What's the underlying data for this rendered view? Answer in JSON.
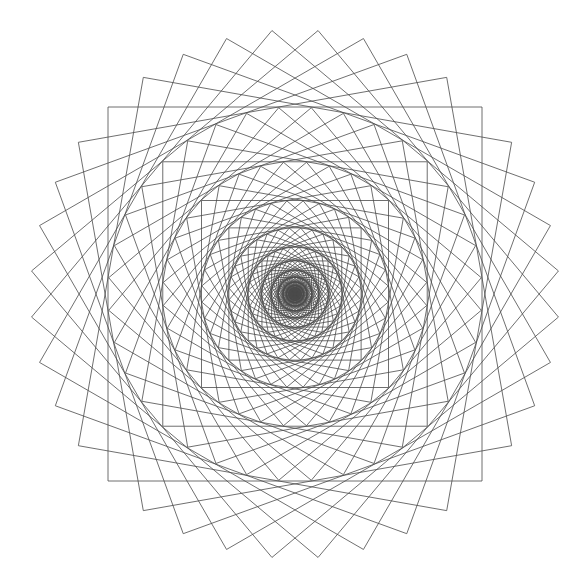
{
  "figure": {
    "title": "",
    "background": "#ffffff",
    "stroke_color": "#4a4a4a",
    "stroke_width": 0.8
  },
  "geometry": {
    "width": 585,
    "height": 587,
    "center": [
      295,
      294
    ],
    "outer_half_size": 187,
    "ring_scale": 0.7071,
    "squares_per_ring": 9,
    "rotation_step_deg": 10,
    "ring_count": 16
  }
}
